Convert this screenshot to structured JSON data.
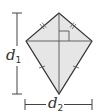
{
  "figure": {
    "type": "kite",
    "fill_color": "#e6e6e6",
    "stroke_color": "#333333",
    "vertices": {
      "top": [
        59,
        13
      ],
      "left": [
        26,
        41
      ],
      "right": [
        92,
        41
      ],
      "bottom": [
        59,
        94
      ]
    },
    "diagonals": [
      "vertical",
      "horizontal"
    ],
    "right_angle_marker": true,
    "congruent_marks": {
      "upper_edges": "double",
      "lower_edges": "single"
    }
  },
  "labels": {
    "d1": {
      "base": "d",
      "sub": "1"
    },
    "d2": {
      "base": "d",
      "sub": "2"
    }
  }
}
